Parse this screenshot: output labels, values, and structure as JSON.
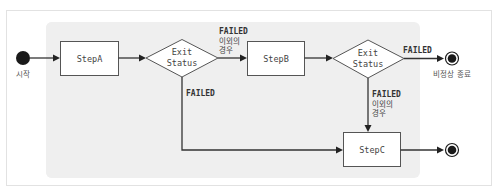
{
  "diagram": {
    "type": "state-flow",
    "start": {
      "label": "시작"
    },
    "steps": {
      "a": {
        "label": "StepA"
      },
      "b": {
        "label": "StepB"
      },
      "c": {
        "label": "StepC"
      }
    },
    "decisions": {
      "d1": {
        "line1": "Exit",
        "line2": "Status"
      },
      "d2": {
        "line1": "Exit",
        "line2": "Status"
      }
    },
    "edges": {
      "d1_to_b": {
        "line1": "FAILED",
        "line2": "이외의",
        "line3": "경우"
      },
      "d1_to_c": {
        "line1": "FAILED"
      },
      "d2_to_end": {
        "line1": "FAILED"
      },
      "d2_to_c": {
        "line1": "FAILED",
        "line2": "이외의",
        "line3": "경우"
      }
    },
    "abnormal_end": {
      "label": "비정상 종료"
    },
    "normal_end": {
      "label": ""
    },
    "colors": {
      "region_fill": "#efefef",
      "node_stroke": "#555555",
      "edge": "#333333",
      "terminal": "#1a1a1a"
    }
  }
}
